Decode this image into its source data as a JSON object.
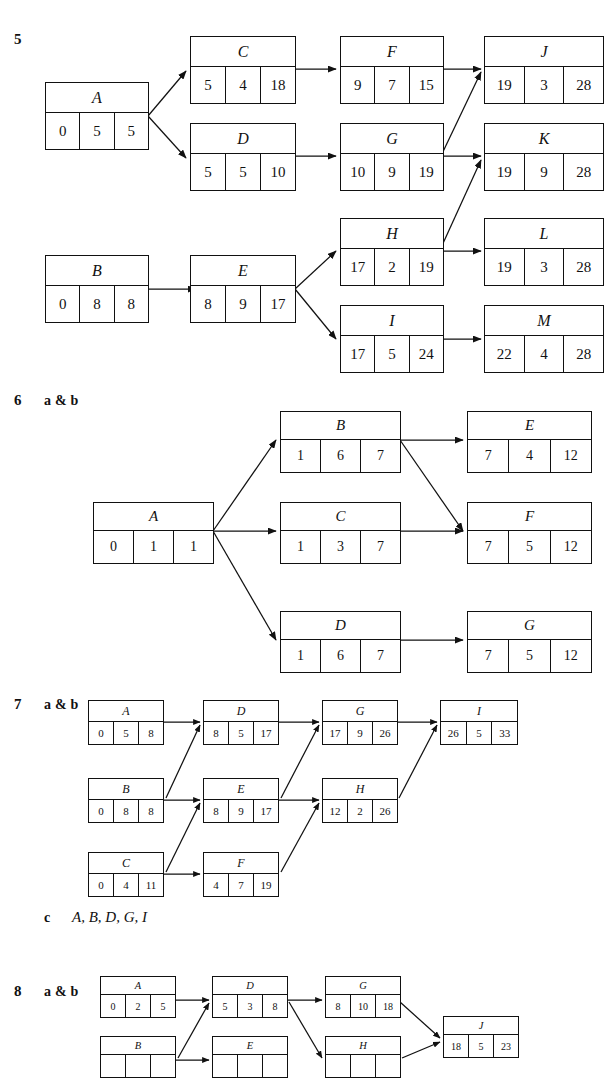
{
  "page": {
    "width": 584,
    "height": 1063,
    "background": "#ffffff",
    "ink": "#111111"
  },
  "questions": [
    {
      "number": "5",
      "parts_label": "",
      "nodes": [
        {
          "id": "A",
          "label": "A",
          "cells": [
            "0",
            "5",
            "5"
          ]
        },
        {
          "id": "B",
          "label": "B",
          "cells": [
            "0",
            "8",
            "8"
          ]
        },
        {
          "id": "C",
          "label": "C",
          "cells": [
            "5",
            "4",
            "18"
          ]
        },
        {
          "id": "D",
          "label": "D",
          "cells": [
            "5",
            "5",
            "10"
          ]
        },
        {
          "id": "E",
          "label": "E",
          "cells": [
            "8",
            "9",
            "17"
          ]
        },
        {
          "id": "F",
          "label": "F",
          "cells": [
            "9",
            "7",
            "15"
          ]
        },
        {
          "id": "G",
          "label": "G",
          "cells": [
            "10",
            "9",
            "19"
          ]
        },
        {
          "id": "H",
          "label": "H",
          "cells": [
            "17",
            "2",
            "19"
          ]
        },
        {
          "id": "I",
          "label": "I",
          "cells": [
            "17",
            "5",
            "24"
          ]
        },
        {
          "id": "J",
          "label": "J",
          "cells": [
            "19",
            "3",
            "28"
          ]
        },
        {
          "id": "K",
          "label": "K",
          "cells": [
            "19",
            "9",
            "28"
          ]
        },
        {
          "id": "L",
          "label": "L",
          "cells": [
            "19",
            "3",
            "28"
          ]
        },
        {
          "id": "M",
          "label": "M",
          "cells": [
            "22",
            "4",
            "28"
          ]
        }
      ]
    },
    {
      "number": "6",
      "parts_label": "a & b",
      "nodes": [
        {
          "id": "A",
          "label": "A",
          "cells": [
            "0",
            "1",
            "1"
          ]
        },
        {
          "id": "B",
          "label": "B",
          "cells": [
            "1",
            "6",
            "7"
          ]
        },
        {
          "id": "C",
          "label": "C",
          "cells": [
            "1",
            "3",
            "7"
          ]
        },
        {
          "id": "D",
          "label": "D",
          "cells": [
            "1",
            "6",
            "7"
          ]
        },
        {
          "id": "E",
          "label": "E",
          "cells": [
            "7",
            "4",
            "12"
          ]
        },
        {
          "id": "F",
          "label": "F",
          "cells": [
            "7",
            "5",
            "12"
          ]
        },
        {
          "id": "G",
          "label": "G",
          "cells": [
            "7",
            "5",
            "12"
          ]
        }
      ]
    },
    {
      "number": "7",
      "parts_label": "a & b",
      "nodes": [
        {
          "id": "A",
          "label": "A",
          "cells": [
            "0",
            "5",
            "8"
          ]
        },
        {
          "id": "B",
          "label": "B",
          "cells": [
            "0",
            "8",
            "8"
          ]
        },
        {
          "id": "C",
          "label": "C",
          "cells": [
            "0",
            "4",
            "11"
          ]
        },
        {
          "id": "D",
          "label": "D",
          "cells": [
            "8",
            "5",
            "17"
          ]
        },
        {
          "id": "E",
          "label": "E",
          "cells": [
            "8",
            "9",
            "17"
          ]
        },
        {
          "id": "F",
          "label": "F",
          "cells": [
            "4",
            "7",
            "19"
          ]
        },
        {
          "id": "G",
          "label": "G",
          "cells": [
            "17",
            "9",
            "26"
          ]
        },
        {
          "id": "H",
          "label": "H",
          "cells": [
            "12",
            "2",
            "26"
          ]
        },
        {
          "id": "I",
          "label": "I",
          "cells": [
            "26",
            "5",
            "33"
          ]
        }
      ],
      "part_c_label": "c",
      "part_c_answer": "A, B, D, G, I"
    },
    {
      "number": "8",
      "parts_label": "a & b",
      "nodes": [
        {
          "id": "A",
          "label": "A",
          "cells": [
            "0",
            "2",
            "5"
          ]
        },
        {
          "id": "B",
          "label": "B",
          "cells": [
            "",
            "",
            ""
          ]
        },
        {
          "id": "D",
          "label": "D",
          "cells": [
            "5",
            "3",
            "8"
          ]
        },
        {
          "id": "E",
          "label": "E",
          "cells": [
            "",
            "",
            ""
          ]
        },
        {
          "id": "G",
          "label": "G",
          "cells": [
            "8",
            "10",
            "18"
          ]
        },
        {
          "id": "H",
          "label": "H",
          "cells": [
            "",
            "",
            ""
          ]
        },
        {
          "id": "J",
          "label": "J",
          "cells": [
            "18",
            "5",
            "23"
          ]
        }
      ]
    }
  ]
}
